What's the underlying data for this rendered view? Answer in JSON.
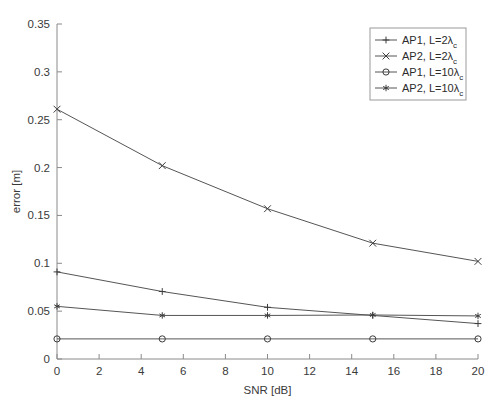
{
  "chart_data": {
    "type": "line",
    "title": "",
    "xlabel": "SNR [dB]",
    "ylabel": "error [m]",
    "xlim": [
      0,
      20
    ],
    "ylim": [
      0,
      0.35
    ],
    "xticks": [
      0,
      2,
      4,
      6,
      8,
      10,
      12,
      14,
      16,
      18,
      20
    ],
    "xtick_labels": [
      "0",
      "2",
      "4",
      "6",
      "8",
      "10",
      "12",
      "14",
      "16",
      "18",
      "20"
    ],
    "yticks": [
      0,
      0.05,
      0.1,
      0.15,
      0.2,
      0.25,
      0.3,
      0.35
    ],
    "ytick_labels": [
      "0",
      "0.05",
      "0.1",
      "0.15",
      "0.2",
      "0.25",
      "0.3",
      "0.35"
    ],
    "grid": false,
    "legend_position": "upper right",
    "x": [
      0,
      5,
      10,
      15,
      20
    ],
    "series": [
      {
        "name": "AP1, L=2λ_c",
        "label_main": "AP1,  L=2λ",
        "label_sub": "c",
        "marker": "plus",
        "values": [
          0.091,
          0.0705,
          0.054,
          0.0455,
          0.037
        ]
      },
      {
        "name": "AP2, L=2λ_c",
        "label_main": "AP2,  L=2λ",
        "label_sub": "c",
        "marker": "x",
        "values": [
          0.261,
          0.202,
          0.157,
          0.121,
          0.102
        ]
      },
      {
        "name": "AP1, L=10λ_c",
        "label_main": "AP1,  L=10λ",
        "label_sub": "c",
        "marker": "circle",
        "values": [
          0.021,
          0.021,
          0.021,
          0.021,
          0.021
        ]
      },
      {
        "name": "AP2, L=10λ_c",
        "label_main": "AP2,  L=10λ",
        "label_sub": "c",
        "marker": "asterisk",
        "values": [
          0.055,
          0.0455,
          0.0455,
          0.046,
          0.045
        ]
      }
    ]
  },
  "colors": {
    "axis": "#8a8a8a",
    "series": "#555555",
    "marker": "#3c3c3c",
    "text": "#2b2b2b",
    "background": "#ffffff"
  }
}
